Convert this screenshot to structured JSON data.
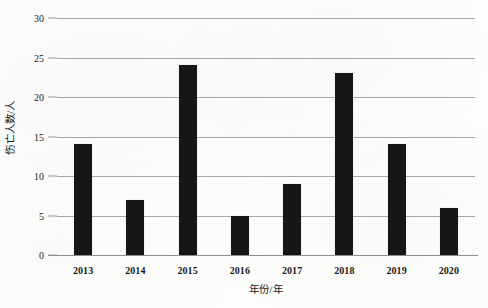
{
  "chart_data": {
    "type": "bar",
    "title": "",
    "subtitle": "",
    "categories": [
      "2013",
      "2014",
      "2015",
      "2016",
      "2017",
      "2018",
      "2019",
      "2020"
    ],
    "values": [
      14,
      7,
      24,
      5,
      9,
      23,
      14,
      6
    ],
    "xlabel": "年份/年",
    "ylabel": "伤亡人数/人",
    "ylim": [
      0,
      30
    ],
    "ytick_values": [
      0,
      5,
      10,
      15,
      20,
      25,
      30
    ],
    "ytick_labels": [
      "0",
      "5",
      "10",
      "15",
      "20",
      "25",
      "30"
    ],
    "grid": "horizontal",
    "legend": "none",
    "bar_color": "#161616",
    "gridline_color": "#a8a8a8",
    "background_color": "#fdfdfc",
    "text_color": "#1a1a1a"
  }
}
